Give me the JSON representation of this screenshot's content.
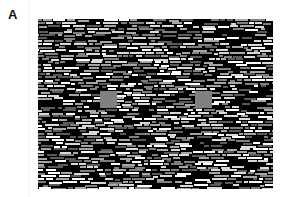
{
  "panel": {
    "label": "A"
  },
  "stimulus": {
    "description": "texture field of horizontal line segments on black background with two uniform gray squares",
    "x": 38,
    "y": 19,
    "width": 235,
    "height": 170,
    "background_color": "#000000",
    "segment_colors": [
      "#ffffff",
      "#d9d9d9",
      "#a6a6a6",
      "#7f7f7f",
      "#5a5a5a"
    ],
    "segment_height": 2,
    "segment_min_length": 4,
    "segment_max_length": 16,
    "seed": 12345
  },
  "targets": [
    {
      "name": "left-gray-square",
      "x": 62,
      "y": 72,
      "size": 17,
      "color": "#808080"
    },
    {
      "name": "right-gray-square",
      "x": 157,
      "y": 72,
      "size": 17,
      "color": "#808080"
    }
  ]
}
